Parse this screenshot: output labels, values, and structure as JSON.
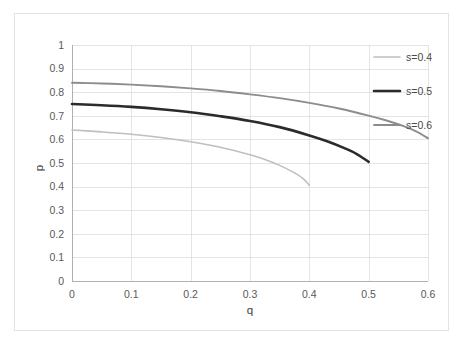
{
  "chart_data": {
    "type": "line",
    "title": "",
    "xlabel": "q",
    "ylabel": "p",
    "xlim": [
      0,
      0.6
    ],
    "ylim": [
      0,
      1
    ],
    "grid": true,
    "legend_position": "top-right-inside",
    "xticks": [
      "0",
      "0.1",
      "0.2",
      "0.3",
      "0.4",
      "0.5",
      "0.6"
    ],
    "yticks": [
      "0",
      "0.1",
      "0.2",
      "0.3",
      "0.4",
      "0.5",
      "0.6",
      "0.7",
      "0.8",
      "0.9",
      "1"
    ],
    "series": [
      {
        "name": "s=0.4",
        "color": "#bfbfbf",
        "width": 1.6,
        "x": [
          0,
          0.05,
          0.1,
          0.15,
          0.2,
          0.25,
          0.3,
          0.325,
          0.35,
          0.375,
          0.39,
          0.4
        ],
        "values": [
          0.64,
          0.632,
          0.622,
          0.608,
          0.59,
          0.567,
          0.535,
          0.515,
          0.49,
          0.458,
          0.433,
          0.405
        ]
      },
      {
        "name": "s=0.5",
        "color": "#2b2b2b",
        "width": 2.6,
        "x": [
          0,
          0.05,
          0.1,
          0.15,
          0.2,
          0.25,
          0.3,
          0.35,
          0.4,
          0.43,
          0.46,
          0.48,
          0.5
        ],
        "values": [
          0.75,
          0.745,
          0.738,
          0.728,
          0.715,
          0.698,
          0.678,
          0.652,
          0.617,
          0.592,
          0.562,
          0.538,
          0.505
        ]
      },
      {
        "name": "s=0.6",
        "color": "#8c8c8c",
        "width": 1.9,
        "x": [
          0,
          0.05,
          0.1,
          0.15,
          0.2,
          0.25,
          0.3,
          0.35,
          0.4,
          0.45,
          0.5,
          0.53,
          0.56,
          0.58,
          0.6
        ],
        "values": [
          0.84,
          0.837,
          0.832,
          0.825,
          0.816,
          0.805,
          0.791,
          0.775,
          0.755,
          0.731,
          0.701,
          0.68,
          0.655,
          0.634,
          0.605
        ]
      }
    ]
  },
  "legend": {
    "entries": [
      {
        "label": "s=0.4"
      },
      {
        "label": "s=0.5"
      },
      {
        "label": "s=0.6"
      }
    ]
  },
  "axes": {
    "x_title": "q",
    "y_title": "p"
  }
}
